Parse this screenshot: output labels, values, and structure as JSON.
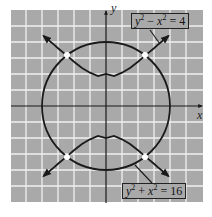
{
  "figure": {
    "type": "graph-of-equations",
    "axes": {
      "x_label": "x",
      "y_label": "y"
    },
    "grid": {
      "on": true,
      "units": 12,
      "background": "#a9a9a9",
      "line_color": "#f2f2f2"
    },
    "curves": [
      {
        "name": "hyperbola",
        "equation_lhs": "y",
        "equation_op": "−",
        "equation_rhs_var": "x",
        "equation_value": "4",
        "label_text": "y² − x² = 4"
      },
      {
        "name": "circle",
        "equation_lhs": "y",
        "equation_op": "+",
        "equation_rhs_var": "x",
        "equation_value": "16",
        "label_text": "y² + x² = 16"
      }
    ],
    "intersection_points": [
      {
        "x": "-√6",
        "y": "√10"
      },
      {
        "x": "√6",
        "y": "√10"
      },
      {
        "x": "-√6",
        "y": "-√10"
      },
      {
        "x": "√6",
        "y": "-√10"
      }
    ],
    "labels": {
      "top": {
        "var1": "y",
        "exp1": "2",
        "op": "−",
        "var2": "x",
        "exp2": "2",
        "eq": "= 4"
      },
      "bottom": {
        "var1": "y",
        "exp1": "2",
        "op": "+",
        "var2": "x",
        "exp2": "2",
        "eq": "= 16"
      }
    }
  }
}
